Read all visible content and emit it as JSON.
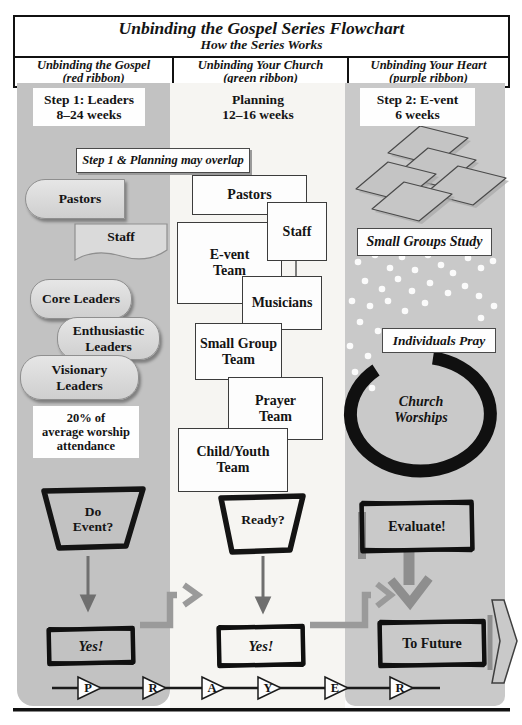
{
  "title": {
    "main": "Unbinding the Gospel Series Flowchart",
    "sub": "How the Series Works"
  },
  "columns": [
    {
      "title": "Unbinding the Gospel",
      "ribbon": "(red ribbon)"
    },
    {
      "title": "Unbinding Your Church",
      "ribbon": "(green ribbon)"
    },
    {
      "title": "Unbinding Your Heart",
      "ribbon": "(purple ribbon)"
    }
  ],
  "gospel": {
    "step_line1": "Step 1: Leaders",
    "step_line2": "8–24 weeks",
    "overlap_note": "Step 1 & Planning may overlap",
    "pastors": "Pastors",
    "staff": "Staff",
    "core": "Core Leaders",
    "enthusiastic": [
      "Enthusiastic",
      "Leaders"
    ],
    "visionary": [
      "Visionary",
      "Leaders"
    ],
    "attendance": [
      "20% of",
      "average worship",
      "attendance"
    ],
    "decision": [
      "Do",
      "Event?"
    ],
    "yes": "Yes!"
  },
  "church": {
    "step_line1": "Planning",
    "step_line2": "12–16 weeks",
    "pastors": "Pastors",
    "staff": "Staff",
    "event_team": [
      "E-vent",
      "Team"
    ],
    "musicians": "Musicians",
    "small_group_team": [
      "Small Group",
      "Team"
    ],
    "prayer_team": [
      "Prayer",
      "Team"
    ],
    "child_youth_team": [
      "Child/Youth",
      "Team"
    ],
    "decision": "Ready?",
    "yes": "Yes!"
  },
  "heart": {
    "step_line1": "Step 2: E-vent",
    "step_line2": "6 weeks",
    "small_groups": "Small Groups Study",
    "individuals": "Individuals Pray",
    "worship": [
      "Church",
      "Worships"
    ],
    "evaluate": "Evaluate!",
    "future": "To Future"
  },
  "timeline": {
    "letters": [
      "P",
      "R",
      "A",
      "Y",
      "E",
      "R"
    ]
  },
  "colors": {
    "column_left_bg": "#c2c2c2",
    "column_mid_bg": "#f6f5f2",
    "column_right_bg": "#c9c9c9",
    "shape_fill": "#dadada",
    "connector_gray": "#9a9a9a",
    "ink": "#141414"
  }
}
